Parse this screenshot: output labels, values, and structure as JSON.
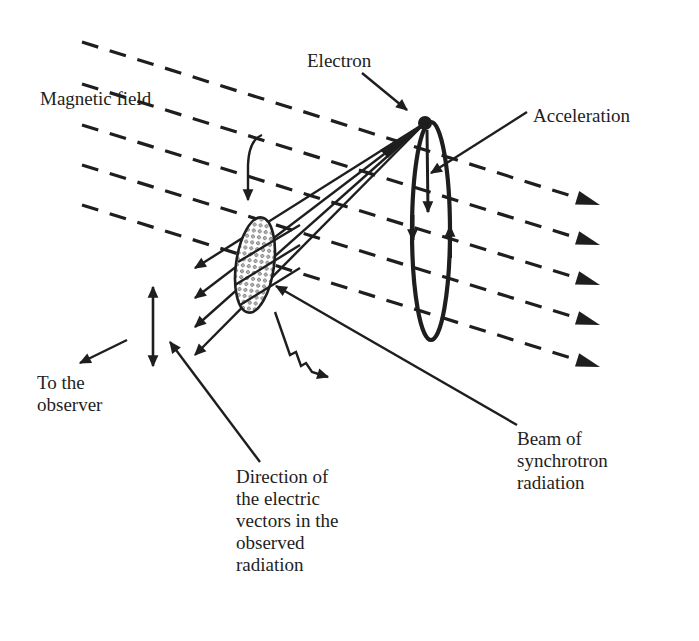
{
  "diagram": {
    "colors": {
      "ink": "#1e1e1e",
      "background": "#ffffff",
      "stipple": "#4a4a4a"
    },
    "labels": {
      "electron": "Electron",
      "magnetic_field": "Magnetic field",
      "acceleration": "Acceleration",
      "to_observer": "To the\nobserver",
      "electric_vectors": "Direction of\nthe electric\nvectors in the\nobserved\nradiation",
      "beam": "Beam of\nsynchrotron\nradiation"
    },
    "field_lines": [
      {
        "x1": 82,
        "y1": 42,
        "x2": 600,
        "y2": 205
      },
      {
        "x1": 82,
        "y1": 84,
        "x2": 600,
        "y2": 245
      },
      {
        "x1": 82,
        "y1": 125,
        "x2": 600,
        "y2": 285
      },
      {
        "x1": 82,
        "y1": 165,
        "x2": 600,
        "y2": 325
      },
      {
        "x1": 82,
        "y1": 205,
        "x2": 600,
        "y2": 367
      }
    ],
    "electron_position": {
      "x": 425,
      "y": 123
    },
    "beam_rays": [
      {
        "x2": 195,
        "y2": 268
      },
      {
        "x2": 195,
        "y2": 298
      },
      {
        "x2": 195,
        "y2": 325
      },
      {
        "x2": 195,
        "y2": 355
      }
    ]
  }
}
